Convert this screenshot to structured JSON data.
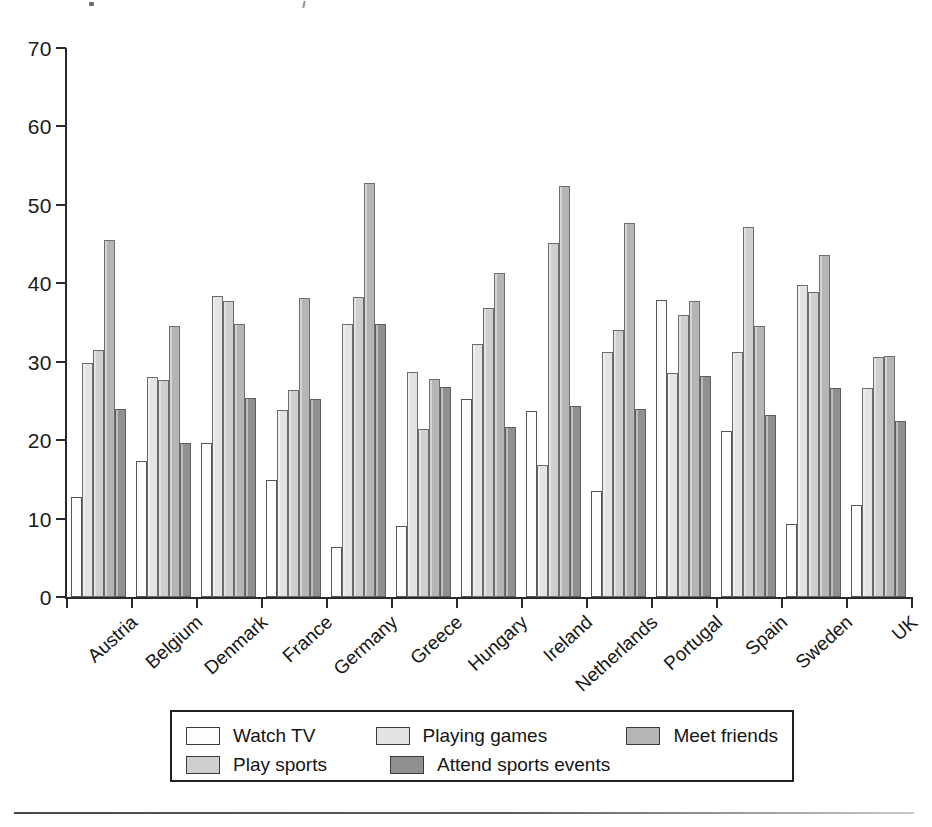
{
  "chart_data": {
    "type": "bar",
    "title": "",
    "subtitle": "",
    "xlabel": "",
    "ylabel": "",
    "ylim": [
      0,
      70
    ],
    "yticks": [
      0,
      10,
      20,
      30,
      40,
      50,
      60,
      70
    ],
    "grid": false,
    "legend_position": "bottom",
    "categories": [
      "Austria",
      "Belgium",
      "Denmark",
      "France",
      "Germany",
      "Greece",
      "Hungary",
      "Ireland",
      "Netherlands",
      "Portugal",
      "Spain",
      "Sweden",
      "UK"
    ],
    "series": [
      {
        "name": "Watch TV",
        "color": "#fdfdfd",
        "values": [
          12.7,
          17.4,
          19.7,
          14.9,
          6.4,
          9.1,
          25.2,
          23.7,
          13.5,
          37.9,
          21.2,
          9.3,
          11.7
        ]
      },
      {
        "name": "Playing games",
        "color": "#e3e3e3",
        "values": [
          29.8,
          28.0,
          38.4,
          23.8,
          34.8,
          28.7,
          32.2,
          16.8,
          31.3,
          28.6,
          31.3,
          39.8,
          26.7
        ]
      },
      {
        "name": "Play sports",
        "color": "#cfcfcf",
        "values": [
          31.5,
          27.7,
          37.7,
          26.4,
          38.2,
          21.4,
          36.8,
          45.2,
          34.1,
          36.0,
          47.2,
          38.9,
          30.6
        ]
      },
      {
        "name": "Meet friends",
        "color": "#b5b5b5",
        "values": [
          45.5,
          34.6,
          34.8,
          38.1,
          52.8,
          27.8,
          41.3,
          52.4,
          47.7,
          37.7,
          34.6,
          43.6,
          30.7
        ]
      },
      {
        "name": "Attend sports events",
        "color": "#909090",
        "values": [
          24.0,
          19.6,
          25.4,
          25.3,
          34.8,
          26.8,
          21.7,
          24.4,
          24.0,
          28.2,
          23.2,
          26.6,
          22.5
        ]
      }
    ]
  },
  "legend": {
    "row1": [
      {
        "label": "Watch TV",
        "series_index": 0
      },
      {
        "label": "Playing games",
        "series_index": 1
      },
      {
        "label": "Meet friends",
        "series_index": 3
      }
    ],
    "row2": [
      {
        "label": "Play sports",
        "series_index": 2
      },
      {
        "label": "Attend sports events",
        "series_index": 4
      }
    ]
  }
}
